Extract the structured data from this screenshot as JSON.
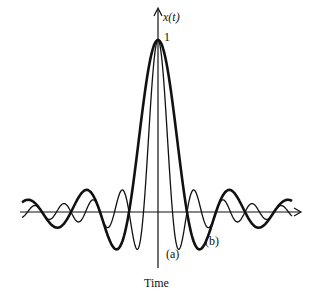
{
  "chart_data": {
    "type": "line",
    "title": "",
    "xlabel": "Time",
    "ylabel": "x(t)",
    "peak_label": "1",
    "ylim": [
      -0.3,
      1.1
    ],
    "grid": false,
    "legend": "inline annotations",
    "series": [
      {
        "name": "(a)",
        "description": "narrow sinc pulse (thin line)",
        "peak": 1,
        "first_zero_t": 1,
        "relative_width": 1,
        "stroke_width": 1.3
      },
      {
        "name": "(b)",
        "description": "wide sinc pulse (thick line)",
        "peak": 1,
        "first_zero_t": 2,
        "relative_width": 2,
        "stroke_width": 2.6
      }
    ],
    "annotations": [
      {
        "text": "(a)",
        "target": "series a first negative lobe"
      },
      {
        "text": "(b)",
        "target": "series b first negative lobe"
      }
    ]
  },
  "labels": {
    "y_axis": "x(t)",
    "peak": "1",
    "a": "(a)",
    "b": "(b)",
    "x_axis": "Time"
  }
}
